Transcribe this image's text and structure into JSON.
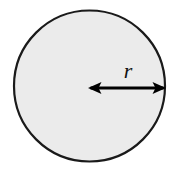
{
  "figure": {
    "name": "circle-radius-diagram",
    "type": "geometry-diagram",
    "background_color": "#ffffff",
    "circle": {
      "fill_color": "#ebebeb",
      "stroke_color": "#1a1a1a",
      "stroke_width": 2.2,
      "center_x": 89.5,
      "center_y": 86,
      "radius": 75.5
    },
    "radius_arrow": {
      "label": "r",
      "label_x": 128,
      "label_y": 78,
      "color": "#000000",
      "start_x": 89.5,
      "end_x": 165,
      "y": 88,
      "line_width": 3.2,
      "double_headed": true,
      "arrowhead_length": 13,
      "arrowhead_half_width": 6
    }
  }
}
